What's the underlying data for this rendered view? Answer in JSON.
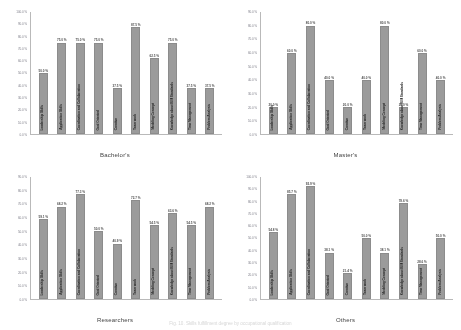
{
  "figure": {
    "caption": "Fig. 10.  Skills fulfillment degree by occupational qualification"
  },
  "chart_data": [
    {
      "type": "bar",
      "title": "Bachelor's",
      "xlabel": "",
      "ylabel": "",
      "ylim": [
        0,
        100
      ],
      "ytick_labels": [
        "0.0 %",
        "10.0 %",
        "20.0 %",
        "30.0 %",
        "40.0 %",
        "50.0 %",
        "60.0 %",
        "70.0 %",
        "80.0 %",
        "90.0 %",
        "100.0 %"
      ],
      "grid": false,
      "legend": "none",
      "categories": [
        "Leadership Skills",
        "Application Skills",
        "Coordination and Collaboration",
        "Goal Oriented",
        "Creative",
        "Team work",
        "Modeling Concept",
        "Knowledge about BIM Standards",
        "Time Management",
        "Problem Analysis"
      ],
      "values": [
        50.0,
        75.0,
        75.0,
        75.0,
        37.5,
        87.5,
        62.5,
        75.0,
        37.5,
        37.5
      ],
      "value_labels": [
        "50.0 %",
        "75.0 %",
        "75.0 %",
        "75.0 %",
        "37.5 %",
        "87.5 %",
        "62.5 %",
        "75.0 %",
        "37.5 %",
        "37.5 %"
      ]
    },
    {
      "type": "bar",
      "title": "Master's",
      "xlabel": "",
      "ylabel": "",
      "ylim": [
        0,
        90
      ],
      "ytick_labels": [
        "0.0 %",
        "10.0 %",
        "20.0 %",
        "30.0 %",
        "40.0 %",
        "50.0 %",
        "60.0 %",
        "70.0 %",
        "80.0 %",
        "90.0 %"
      ],
      "grid": false,
      "legend": "none",
      "categories": [
        "Leadership Skills",
        "Application Skills",
        "Coordination and Collaboration",
        "Goal Oriented",
        "Creative",
        "Team work",
        "Modeling Concept",
        "Knowledge about BIM Standards",
        "Time Management",
        "Problem Analysis"
      ],
      "values": [
        20.0,
        60.0,
        80.0,
        40.0,
        20.0,
        40.0,
        80.0,
        20.0,
        60.0,
        40.0
      ],
      "value_labels": [
        "20.0 %",
        "60.0 %",
        "80.0 %",
        "40.0 %",
        "20.0 %",
        "40.0 %",
        "80.0 %",
        "20.0 %",
        "60.0 %",
        "40.0 %"
      ]
    },
    {
      "type": "bar",
      "title": "Researchers",
      "xlabel": "",
      "ylabel": "",
      "ylim": [
        0,
        90
      ],
      "ytick_labels": [
        "0.0 %",
        "10.0 %",
        "20.0 %",
        "30.0 %",
        "40.0 %",
        "50.0 %",
        "60.0 %",
        "70.0 %",
        "80.0 %",
        "90.0 %"
      ],
      "grid": false,
      "legend": "none",
      "categories": [
        "Leadership Skills",
        "Application Skills",
        "Coordination and Collaboration",
        "Goal Oriented",
        "Creative",
        "Team work",
        "Modeling Concept",
        "Knowledge about BIM Standards",
        "Time Management",
        "Problem Analysis"
      ],
      "values": [
        59.1,
        68.2,
        77.3,
        50.0,
        40.9,
        72.7,
        54.5,
        63.6,
        54.5,
        68.2
      ],
      "value_labels": [
        "59.1 %",
        "68.2 %",
        "77.3 %",
        "50.0 %",
        "40.9 %",
        "72.7 %",
        "54.5 %",
        "63.6 %",
        "54.5 %",
        "68.2 %"
      ]
    },
    {
      "type": "bar",
      "title": "Others",
      "xlabel": "",
      "ylabel": "",
      "ylim": [
        0,
        100
      ],
      "ytick_labels": [
        "0.0 %",
        "10.0 %",
        "20.0 %",
        "30.0 %",
        "40.0 %",
        "50.0 %",
        "60.0 %",
        "70.0 %",
        "80.0 %",
        "90.0 %",
        "100.0 %"
      ],
      "grid": false,
      "legend": "none",
      "categories": [
        "Leadership Skills",
        "Application Skills",
        "Coordination and Collaboration",
        "Goal Oriented",
        "Creative",
        "Team work",
        "Modeling Concept",
        "Knowledge about BIM Standards",
        "Time Management",
        "Problem Analysis"
      ],
      "values": [
        54.8,
        85.7,
        92.9,
        38.1,
        21.4,
        50.0,
        38.1,
        78.6,
        28.6,
        50.0
      ],
      "value_labels": [
        "54.8 %",
        "85.7 %",
        "92.9 %",
        "38.1 %",
        "21.4 %",
        "50.0 %",
        "38.1 %",
        "78.6 %",
        "28.6 %",
        "50.0 %"
      ]
    }
  ],
  "style": {
    "bar_color": "#9a9a9a",
    "axis_color": "#b9b9b9",
    "tick_text_color": "#7b7b86",
    "value_text_color": "#4a4a4a",
    "category_text_color": "#1f1f1f",
    "title_color": "#3a3a3a",
    "background": "#ffffff"
  }
}
